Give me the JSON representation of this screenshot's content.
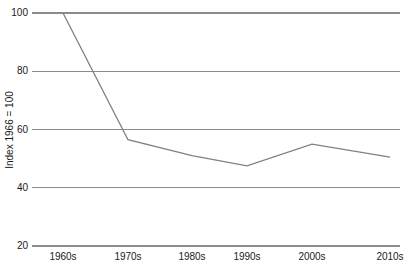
{
  "chart_data": {
    "type": "line",
    "title": "",
    "subtitle": "",
    "xlabel": "",
    "ylabel": "Index 1966 = 100",
    "categories": [
      "1960s",
      "1970s",
      "1980s",
      "1990s",
      "2000s",
      "2010s"
    ],
    "series": [
      {
        "name": "Index",
        "values": [
          100,
          56.5,
          51,
          47.5,
          55,
          50.5
        ]
      }
    ],
    "ylim": [
      20,
      100
    ],
    "yticks": [
      20,
      40,
      60,
      80,
      100
    ],
    "ytick_labels": [
      "20",
      "40",
      "60",
      "80",
      "100"
    ],
    "grid": true,
    "grid_axis": "y",
    "legend": false,
    "legend_position": "none",
    "colors": {
      "line": "#808080",
      "grid": "#8c8c8c",
      "text": "#1a1a1a",
      "background": "#ffffff"
    }
  }
}
